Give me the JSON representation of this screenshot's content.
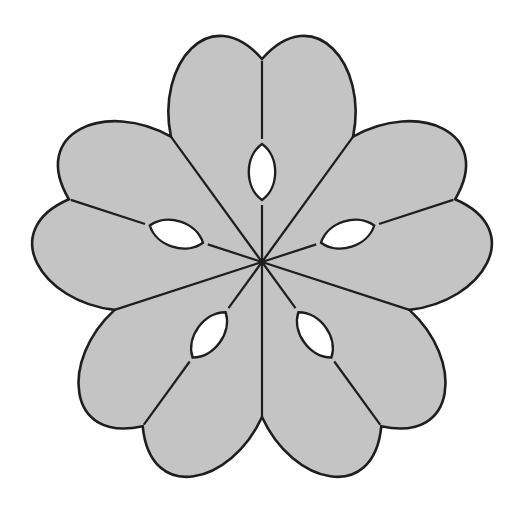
{
  "figure": {
    "width": 510,
    "height": 507,
    "background": "#ffffff",
    "fill": "#c4c4c4",
    "stroke": "#1e1e1e",
    "hole_fill": "#ffffff",
    "center": [
      262,
      262
    ],
    "petal_count": 5,
    "petal": {
      "notch_radius": 203,
      "cusp_radius": 155,
      "cusp_angle_deg": 36,
      "lobe_ctrl_1": [
        -106,
        -198
      ],
      "lobe_ctrl_2": [
        -52,
        -262
      ]
    },
    "hole": {
      "center_radius": 90,
      "half_width": 13,
      "half_length": 28
    }
  }
}
